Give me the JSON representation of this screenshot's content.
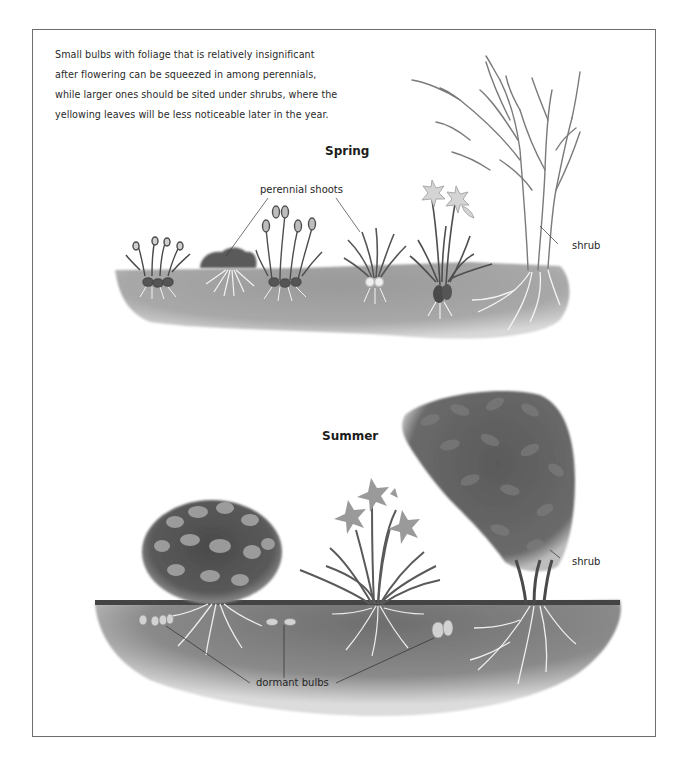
{
  "intro_text": {
    "lines": [
      "Small bulbs with foliage that is relatively insignificant",
      "after flowering can be squeezed in among perennials,",
      "while larger ones should be sited under shrubs, where the",
      "yellowing leaves will be less noticeable later in the year."
    ]
  },
  "spring": {
    "heading": "Spring",
    "labels": {
      "perennial_shoots": "perennial shoots",
      "shrub": "shrub"
    },
    "plants": [
      "snowdrops",
      "perennial-shoot-clump",
      "crocuses",
      "perennial-shoot-leaves",
      "daffodil",
      "bare-shrub"
    ]
  },
  "summer": {
    "heading": "Summer",
    "labels": {
      "shrub": "shrub",
      "dormant_bulbs": "dormant bulbs"
    },
    "plants": [
      "round-flowering-shrub",
      "day-lily",
      "leafy-shrub"
    ]
  },
  "colors": {
    "ink": "#262626",
    "soil": "#8c8c8c",
    "soil_dark": "#6a6a6a",
    "foliage": "#5e5e5e",
    "border": "#6e6e6e"
  }
}
